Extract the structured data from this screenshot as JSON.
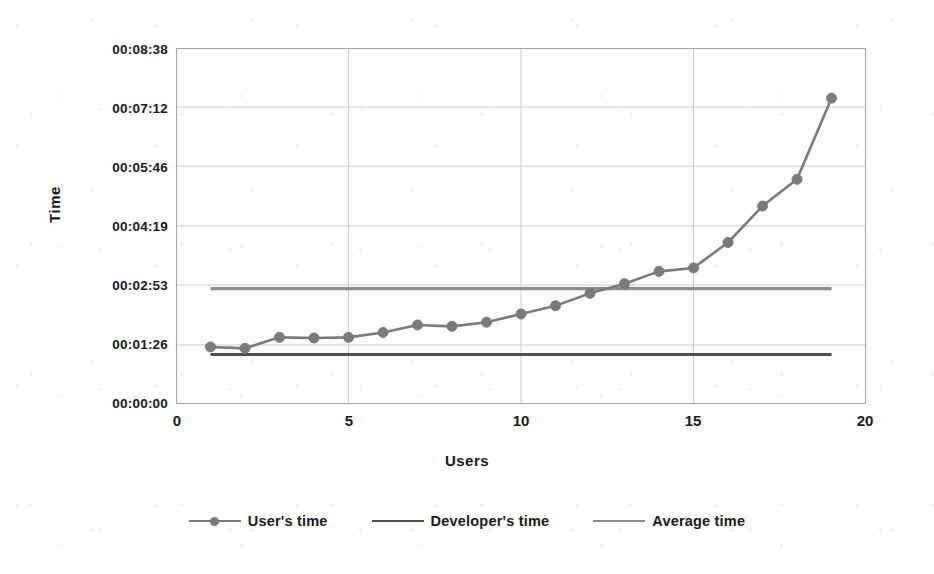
{
  "chart_data": {
    "type": "line",
    "title": "",
    "xlabel": "Users",
    "ylabel": "Time",
    "xlim": [
      0,
      20
    ],
    "ylim_seconds": [
      0,
      518
    ],
    "grid": true,
    "legend_position": "bottom",
    "x_ticks": [
      "0",
      "5",
      "10",
      "15",
      "20"
    ],
    "x_tick_values": [
      0,
      5,
      10,
      15,
      20
    ],
    "y_ticks": [
      "00:00:00",
      "00:01:26",
      "00:02:53",
      "00:04:19",
      "00:05:46",
      "00:07:12",
      "00:08:38"
    ],
    "y_tick_seconds": [
      0,
      86,
      173,
      259,
      346,
      432,
      518
    ],
    "x": [
      1,
      2,
      3,
      4,
      5,
      6,
      7,
      8,
      9,
      10,
      11,
      12,
      13,
      14,
      15,
      16,
      17,
      18,
      19
    ],
    "series": [
      {
        "name": "User's time",
        "type": "line-markers",
        "color": "#7b7b7b",
        "marker": "circle",
        "values_seconds": [
          83,
          81,
          97,
          96,
          97,
          104,
          115,
          113,
          119,
          131,
          143,
          161,
          175,
          193,
          198,
          235,
          288,
          327,
          445
        ],
        "values_formatted": [
          "00:01:23",
          "00:01:21",
          "00:01:37",
          "00:01:36",
          "00:01:37",
          "00:01:44",
          "00:01:55",
          "00:01:53",
          "00:01:59",
          "00:02:11",
          "00:02:23",
          "00:02:41",
          "00:02:55",
          "00:03:13",
          "00:03:18",
          "00:03:55",
          "00:04:48",
          "00:05:27",
          "00:07:25"
        ]
      },
      {
        "name": "Developer's time",
        "type": "hline",
        "color": "#555555",
        "value_seconds": 72,
        "value_formatted": "00:01:12"
      },
      {
        "name": "Average time",
        "type": "hline",
        "color": "#8a8a8a",
        "value_seconds": 168,
        "value_formatted": "00:02:48"
      }
    ]
  },
  "legend": {
    "items": [
      {
        "label": "User's time"
      },
      {
        "label": "Developer's time"
      },
      {
        "label": "Average time"
      }
    ]
  },
  "colors": {
    "user_line": "#7b7b7b",
    "developer_line": "#4f4f4f",
    "average_line": "#8c8c8c",
    "grid": "#c9c9c9",
    "axis": "#a8a8a8",
    "text": "#111111",
    "background": "#ffffff"
  }
}
